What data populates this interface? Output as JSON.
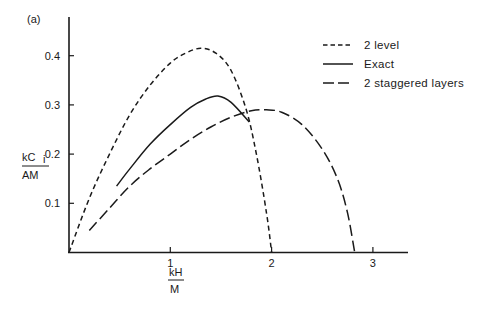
{
  "panel_label": "(a)",
  "chart_data": {
    "type": "line",
    "title": "",
    "xlabel_num": "kH",
    "xlabel_den": "M",
    "ylabel_num": "kC",
    "ylabel_sub": "i",
    "ylabel_den": "AM",
    "xlim": [
      0,
      3.35
    ],
    "ylim": [
      0,
      0.47
    ],
    "x_ticks": [
      {
        "v": 1,
        "label": "1"
      },
      {
        "v": 2,
        "label": "2"
      },
      {
        "v": 3,
        "label": "3"
      }
    ],
    "y_ticks": [
      {
        "v": 0.1,
        "label": "0.1"
      },
      {
        "v": 0.2,
        "label": "0.2"
      },
      {
        "v": 0.3,
        "label": "0.3"
      },
      {
        "v": 0.4,
        "label": "0.4"
      }
    ],
    "grid": false,
    "legend_position": "upper right",
    "series": [
      {
        "name": "2 level",
        "style": "short-dash",
        "x": [
          0,
          0.2,
          0.4,
          0.6,
          0.8,
          1.0,
          1.15,
          1.3,
          1.45,
          1.6,
          1.75,
          1.85,
          1.95,
          2.0
        ],
        "y": [
          0,
          0.11,
          0.2,
          0.28,
          0.34,
          0.385,
          0.405,
          0.415,
          0.405,
          0.37,
          0.29,
          0.2,
          0.08,
          0
        ]
      },
      {
        "name": "Exact",
        "style": "solid",
        "x": [
          0.47,
          0.6,
          0.8,
          1.0,
          1.2,
          1.35,
          1.47,
          1.6,
          1.78
        ],
        "y": [
          0.135,
          0.17,
          0.22,
          0.26,
          0.295,
          0.312,
          0.318,
          0.305,
          0.265
        ]
      },
      {
        "name": "2 staggered layers",
        "style": "long-dash",
        "x": [
          0.2,
          0.4,
          0.6,
          0.8,
          1.0,
          1.2,
          1.4,
          1.6,
          1.8,
          1.95,
          2.1,
          2.3,
          2.5,
          2.65,
          2.75,
          2.82
        ],
        "y": [
          0.045,
          0.09,
          0.135,
          0.17,
          0.2,
          0.23,
          0.255,
          0.275,
          0.288,
          0.29,
          0.285,
          0.26,
          0.21,
          0.15,
          0.08,
          0
        ]
      }
    ]
  },
  "legend": [
    {
      "label": "2 level",
      "dash": "4,3"
    },
    {
      "label": "Exact",
      "dash": ""
    },
    {
      "label": "2 staggered layers",
      "dash": "10,4"
    }
  ]
}
